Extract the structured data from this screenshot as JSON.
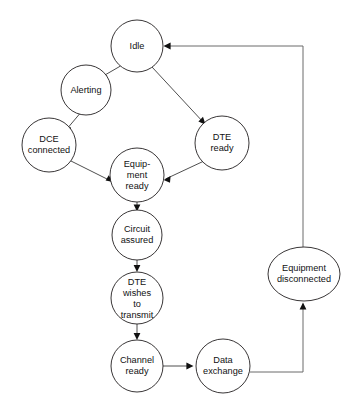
{
  "diagram": {
    "type": "state-transition-diagram",
    "background_color": "#ffffff",
    "stroke_color": "#231f20",
    "text_color": "#111111",
    "nodes": [
      {
        "id": "idle",
        "name": "Idle",
        "lines": [
          "Idle"
        ],
        "shape": "circle",
        "cx": 137,
        "cy": 46,
        "rx": 26,
        "ry": 26
      },
      {
        "id": "alerting",
        "name": "Alerting",
        "lines": [
          "Alerting"
        ],
        "shape": "circle",
        "cx": 86,
        "cy": 90,
        "rx": 25,
        "ry": 25
      },
      {
        "id": "dce_connected",
        "name": "DCE connected",
        "lines": [
          "DCE",
          "connected"
        ],
        "shape": "circle",
        "cx": 49,
        "cy": 145,
        "rx": 27,
        "ry": 27
      },
      {
        "id": "dte_ready",
        "name": "DTE ready",
        "lines": [
          "DTE",
          "ready"
        ],
        "shape": "circle",
        "cx": 222,
        "cy": 143,
        "rx": 27,
        "ry": 27
      },
      {
        "id": "equipment_ready",
        "name": "Equipment ready",
        "lines": [
          "Equip-",
          "ment",
          "ready"
        ],
        "shape": "circle",
        "cx": 137,
        "cy": 175,
        "rx": 27,
        "ry": 27
      },
      {
        "id": "circuit_assured",
        "name": "Circuit assured",
        "lines": [
          "Circuit",
          "assured"
        ],
        "shape": "circle",
        "cx": 137,
        "cy": 235,
        "rx": 25,
        "ry": 25
      },
      {
        "id": "dte_wishes_to_transmit",
        "name": "DTE wishes to transmit",
        "lines": [
          "DTE",
          "wishes",
          "to",
          "transmit"
        ],
        "shape": "circle",
        "cx": 137,
        "cy": 298,
        "rx": 26,
        "ry": 26
      },
      {
        "id": "channel_ready",
        "name": "Channel ready",
        "lines": [
          "Channel",
          "ready"
        ],
        "shape": "circle",
        "cx": 137,
        "cy": 366,
        "rx": 26,
        "ry": 26
      },
      {
        "id": "data_exchange",
        "name": "Data exchange",
        "lines": [
          "Data",
          "exchange"
        ],
        "shape": "circle",
        "cx": 223,
        "cy": 366,
        "rx": 27,
        "ry": 27
      },
      {
        "id": "equipment_disconnected",
        "name": "Equipment disconnected",
        "lines": [
          "Equipment",
          "disconnected"
        ],
        "shape": "ellipse",
        "cx": 304,
        "cy": 274,
        "rx": 36,
        "ry": 27
      }
    ],
    "edges": [
      {
        "id": "idle-to-alerting",
        "from": "idle",
        "to": "alerting",
        "kind": "straight",
        "arrow": true
      },
      {
        "id": "alerting-to-dce-connected",
        "from": "alerting",
        "to": "dce_connected",
        "kind": "straight",
        "arrow": true
      },
      {
        "id": "dce-connected-to-equipment-ready",
        "from": "dce_connected",
        "to": "equipment_ready",
        "kind": "straight",
        "arrow": true
      },
      {
        "id": "idle-to-dte-ready",
        "from": "idle",
        "to": "dte_ready",
        "kind": "straight",
        "arrow": true
      },
      {
        "id": "dte-ready-to-equipment-ready",
        "from": "dte_ready",
        "to": "equipment_ready",
        "kind": "straight",
        "arrow": true
      },
      {
        "id": "equipment-ready-to-circuit-assured",
        "from": "equipment_ready",
        "to": "circuit_assured",
        "kind": "straight",
        "arrow": true
      },
      {
        "id": "circuit-assured-to-dte-wishes",
        "from": "circuit_assured",
        "to": "dte_wishes_to_transmit",
        "kind": "straight",
        "arrow": true
      },
      {
        "id": "dte-wishes-to-channel-ready",
        "from": "dte_wishes_to_transmit",
        "to": "channel_ready",
        "kind": "straight",
        "arrow": true
      },
      {
        "id": "channel-ready-to-data-exchange",
        "from": "channel_ready",
        "to": "data_exchange",
        "kind": "straight",
        "arrow": true
      },
      {
        "id": "data-exchange-to-equipment-disconnected",
        "from": "data_exchange",
        "to": "equipment_disconnected",
        "kind": "orthogonal",
        "arrow": true
      },
      {
        "id": "equipment-disconnected-to-idle",
        "from": "equipment_disconnected",
        "to": "idle",
        "kind": "orthogonal",
        "arrow": true
      }
    ]
  }
}
